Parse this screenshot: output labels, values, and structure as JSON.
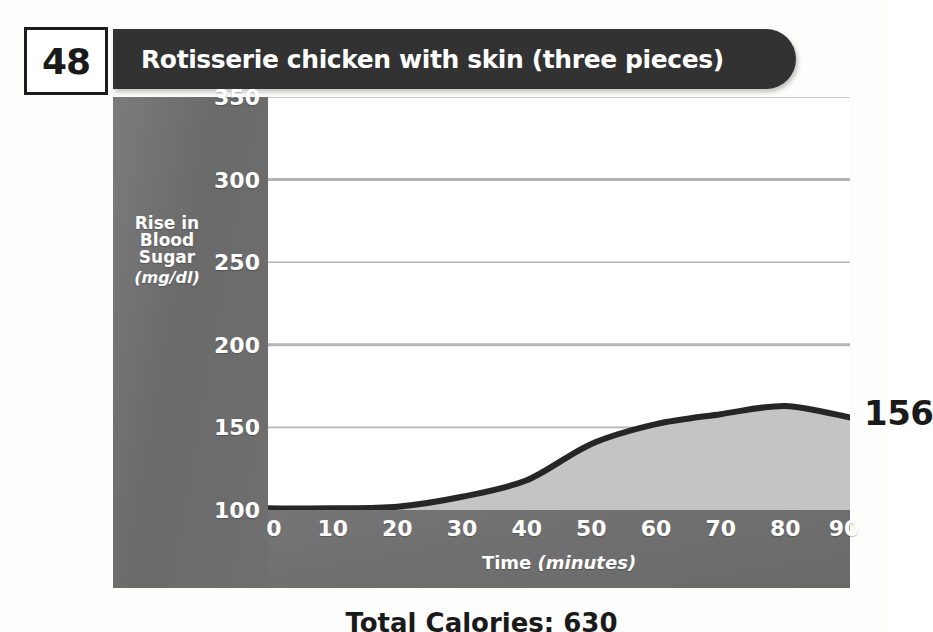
{
  "page": {
    "number": "48",
    "title": "Rotisserie chicken with skin (three pieces)",
    "footer_caption": "Total Calories: 630"
  },
  "colors": {
    "title_bar": "#323232",
    "panel_gray": "#6e6e6e",
    "plot_background": "#ffffff",
    "curve_line": "#262626",
    "area_fill": "#c4c4c4",
    "gridline": "#b5b5b5",
    "badge_border": "#1c1c1c"
  },
  "chart_data": {
    "type": "area",
    "title": "Rotisserie chicken with skin (three pieces)",
    "xlabel": "Time",
    "xlabel_units": "(minutes)",
    "ylabel": "Rise in Blood Sugar",
    "ylabel_units": "(mg/dl)",
    "xlim": [
      0,
      90
    ],
    "ylim": [
      100,
      350
    ],
    "grid": true,
    "legend": "none",
    "xticks": [
      "0",
      "10",
      "20",
      "30",
      "40",
      "50",
      "60",
      "70",
      "80",
      "90"
    ],
    "yticks": [
      "100",
      "150",
      "200",
      "250",
      "300",
      "350"
    ],
    "x": [
      0,
      10,
      20,
      30,
      40,
      50,
      60,
      70,
      80,
      90
    ],
    "values": [
      101,
      101,
      102,
      108,
      118,
      140,
      152,
      158,
      163,
      156
    ],
    "end_value_label": "156",
    "series": [
      {
        "name": "Rise in Blood Sugar",
        "values": [
          101,
          101,
          102,
          108,
          118,
          140,
          152,
          158,
          163,
          156
        ]
      }
    ]
  }
}
